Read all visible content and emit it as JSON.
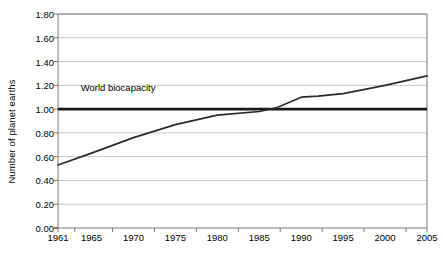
{
  "chart_data": {
    "type": "line",
    "title": "",
    "xlabel": "",
    "ylabel": "Number of planet earths",
    "ylim": [
      0.0,
      1.8
    ],
    "xlim": [
      1961,
      2005
    ],
    "grid": true,
    "legend": "none",
    "y_ticks": [
      "0.00",
      "0.20",
      "0.40",
      "0.60",
      "0.80",
      "1.00",
      "1.20",
      "1.40",
      "1.60",
      "1.80"
    ],
    "y_tick_values": [
      0.0,
      0.2,
      0.4,
      0.6,
      0.8,
      1.0,
      1.2,
      1.4,
      1.6,
      1.8
    ],
    "x_tick_labels": [
      "1961",
      "1965",
      "1970",
      "1975",
      "1980",
      "1985",
      "1990",
      "1995",
      "2000",
      "2005"
    ],
    "x_tick_values": [
      1961,
      1965,
      1970,
      1975,
      1980,
      1985,
      1990,
      1995,
      2000,
      2005
    ],
    "series": [
      {
        "name": "Ecological footprint",
        "x": [
          1961,
          1965,
          1970,
          1975,
          1980,
          1985,
          1987,
          1990,
          1992,
          1995,
          2000,
          2005
        ],
        "values": [
          0.53,
          0.63,
          0.76,
          0.87,
          0.95,
          0.98,
          1.01,
          1.1,
          1.11,
          1.13,
          1.2,
          1.28
        ]
      }
    ],
    "reference_lines": [
      {
        "name": "world-biocapacity",
        "label": "World biocapacity",
        "value": 1.0,
        "color": "#1a1a1a",
        "width": 2.6
      }
    ],
    "annotations": [
      {
        "name": "world-biocapacity-annotation",
        "text": "World biocapacity",
        "x": 1963.7,
        "y": 1.18
      }
    ],
    "colors": {
      "line": "#2b2b2b",
      "grid": "#c8c8c8",
      "axis": "#7a7a7a",
      "text": "#000000",
      "background": "#ffffff"
    }
  }
}
